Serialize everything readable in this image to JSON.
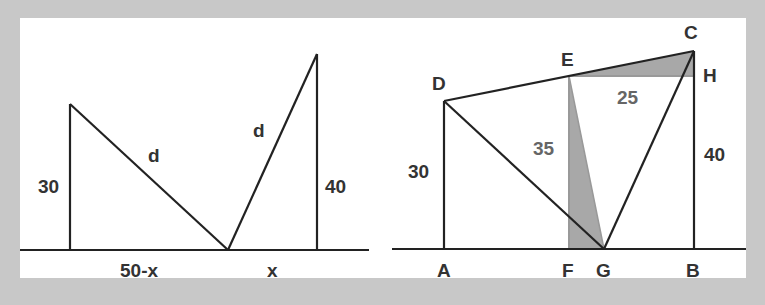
{
  "left_figure": {
    "labels": {
      "left_height": "30",
      "right_height": "40",
      "left_hyp": "d",
      "right_hyp": "d",
      "left_base": "50-x",
      "right_base": "x"
    }
  },
  "right_figure": {
    "points": {
      "A": "A",
      "B": "B",
      "C": "C",
      "D": "D",
      "E": "E",
      "F": "F",
      "G": "G",
      "H": "H"
    },
    "lengths": {
      "AD": "30",
      "BC": "40",
      "EF": "35",
      "EH": "25"
    }
  },
  "colors": {
    "background": "#c8c8c8",
    "panel": "#ffffff",
    "line": "#222222",
    "shade": "#a8a8a8"
  }
}
